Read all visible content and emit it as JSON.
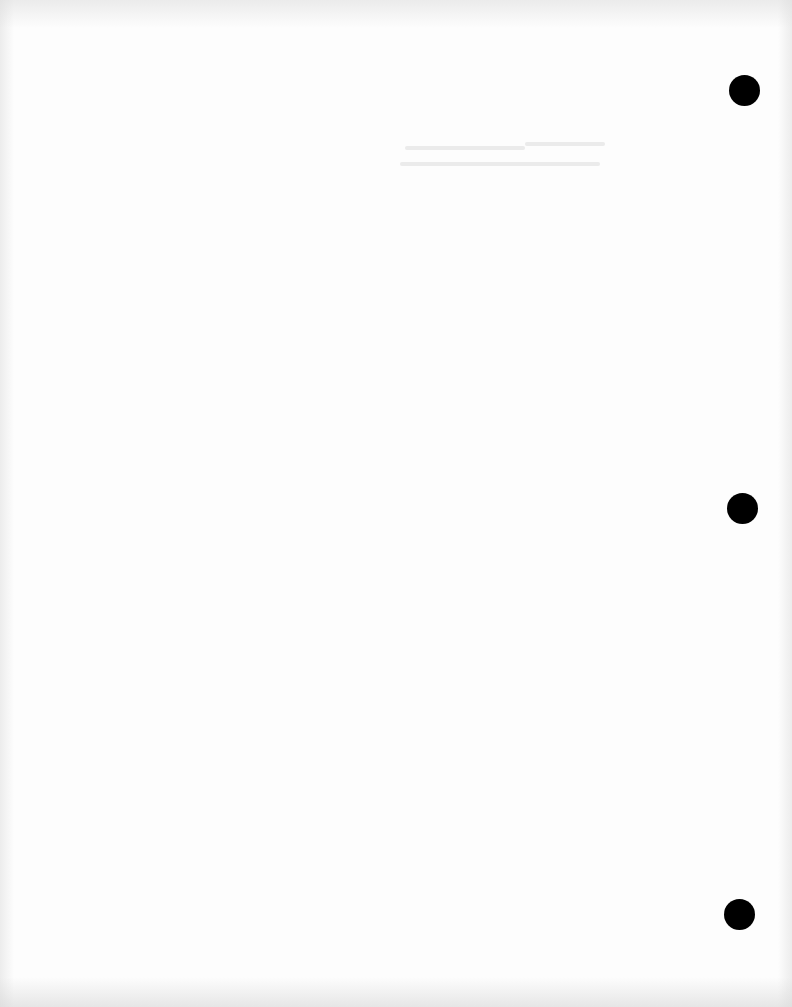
{
  "document": {
    "type": "blank scanned page",
    "background_color": "#fdfdfd",
    "punch_holes": [
      {
        "cx": 744,
        "cy": 90,
        "r": 15,
        "color": "#000000"
      },
      {
        "cx": 742,
        "cy": 508,
        "r": 15,
        "color": "#000000"
      },
      {
        "cx": 739,
        "cy": 914,
        "r": 15,
        "color": "#000000"
      }
    ],
    "text": []
  }
}
